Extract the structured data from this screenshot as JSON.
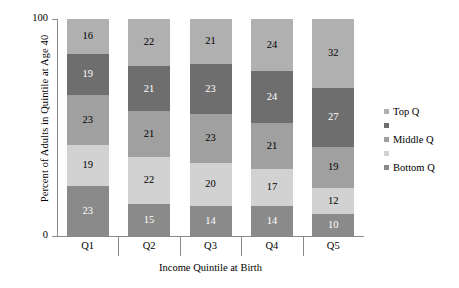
{
  "chart_data": {
    "type": "bar",
    "stacked": true,
    "title": "",
    "xlabel": "Income Quintile at Birth",
    "ylabel": "Percent of Adults in Quintile at Age 40",
    "categories": [
      "Q1",
      "Q2",
      "Q3",
      "Q4",
      "Q5"
    ],
    "ylim": [
      0,
      100
    ],
    "yticks": [
      "0",
      "100"
    ],
    "grid": false,
    "legend_position": "right",
    "series": [
      {
        "name": "Top Q",
        "color": "#b0b0b0",
        "label_color": "#000000",
        "values": [
          16,
          22,
          21,
          24,
          32
        ]
      },
      {
        "name": "",
        "color": "#6e6e6e",
        "label_color": "#ffffff",
        "values": [
          19,
          21,
          23,
          24,
          27
        ]
      },
      {
        "name": "Middle Q",
        "color": "#a0a0a0",
        "label_color": "#000000",
        "values": [
          23,
          21,
          23,
          21,
          19
        ]
      },
      {
        "name": "",
        "color": "#d2d2d2",
        "label_color": "#000000",
        "values": [
          19,
          22,
          20,
          17,
          12
        ]
      },
      {
        "name": "Bottom Q",
        "color": "#8a8a8a",
        "label_color": "#ffffff",
        "values": [
          23,
          15,
          14,
          14,
          10
        ]
      }
    ]
  }
}
